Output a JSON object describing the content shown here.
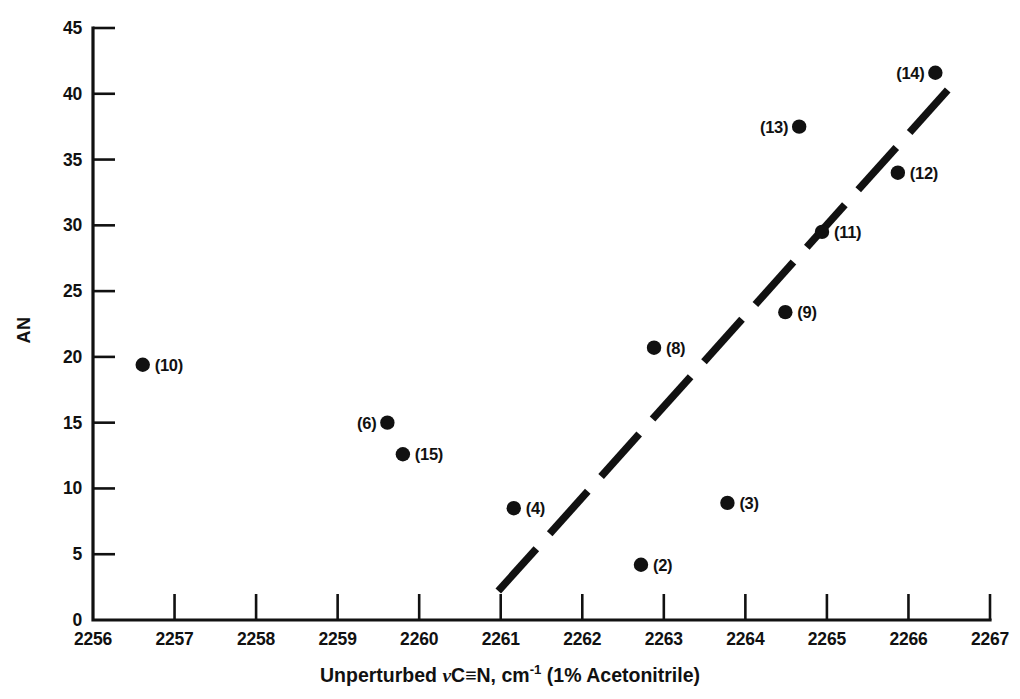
{
  "chart_data": {
    "type": "scatter",
    "title": "",
    "xlabel": "Unperturbed νC≡N, cm-1 (1% Acetonitrile)",
    "xlabel_parts": {
      "prefix": "Unperturbed ",
      "nu": "ν",
      "mid": "C≡N, cm",
      "superscript": "-1",
      "suffix": " (1% Acetonitrile)"
    },
    "ylabel": "AN",
    "xlim": [
      2256,
      2267
    ],
    "ylim": [
      0,
      45
    ],
    "grid": false,
    "legend": "none",
    "xticks": [
      2256,
      2257,
      2258,
      2259,
      2260,
      2261,
      2262,
      2263,
      2264,
      2265,
      2266,
      2267
    ],
    "xtick_labels": [
      "2256",
      "2257",
      "2258",
      "2259",
      "2260",
      "2261",
      "2262",
      "2263",
      "2264",
      "2265",
      "2266",
      "2267"
    ],
    "yticks": [
      0,
      5,
      10,
      15,
      20,
      25,
      30,
      35,
      40,
      45
    ],
    "ytick_labels": [
      "0",
      "5",
      "10",
      "15",
      "20",
      "25",
      "30",
      "35",
      "40",
      "45"
    ],
    "points": [
      {
        "label": "(10)",
        "x": 2256.61,
        "y": 19.4,
        "label_side": "right"
      },
      {
        "label": "(6)",
        "x": 2259.61,
        "y": 15.0,
        "label_side": "left"
      },
      {
        "label": "(15)",
        "x": 2259.8,
        "y": 12.6,
        "label_side": "right"
      },
      {
        "label": "(4)",
        "x": 2261.16,
        "y": 8.5,
        "label_side": "right"
      },
      {
        "label": "(2)",
        "x": 2262.72,
        "y": 4.2,
        "label_side": "right"
      },
      {
        "label": "(8)",
        "x": 2262.88,
        "y": 20.7,
        "label_side": "right"
      },
      {
        "label": "(3)",
        "x": 2263.78,
        "y": 8.9,
        "label_side": "right"
      },
      {
        "label": "(9)",
        "x": 2264.49,
        "y": 23.4,
        "label_side": "right"
      },
      {
        "label": "(13)",
        "x": 2264.66,
        "y": 37.5,
        "label_side": "left"
      },
      {
        "label": "(11)",
        "x": 2264.94,
        "y": 29.5,
        "label_side": "right"
      },
      {
        "label": "(12)",
        "x": 2265.87,
        "y": 34.0,
        "label_side": "right"
      },
      {
        "label": "(14)",
        "x": 2266.33,
        "y": 41.6,
        "label_side": "left"
      }
    ],
    "trend_line": {
      "style": "dashed",
      "x_start": 2260.97,
      "y_start": 2.2,
      "x_end": 2266.6,
      "y_end": 41.1
    },
    "colors": {
      "marker": "#111111",
      "axis": "#111111",
      "trend": "#111111",
      "background": "#ffffff"
    }
  }
}
